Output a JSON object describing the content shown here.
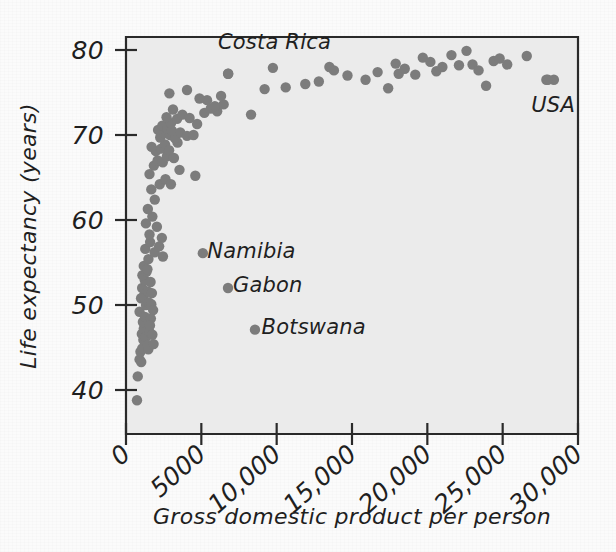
{
  "figure": {
    "background_color": "#fbfbfb",
    "plot_background_color": "#ebebeb",
    "axis_color": "#2a2a2a",
    "point_color": "#7c7c7c"
  },
  "chart_data": {
    "type": "scatter",
    "title": "",
    "xlabel": "Gross domestic product per person",
    "ylabel": "Life expectancy (years)",
    "xlim": [
      0,
      30000
    ],
    "ylim": [
      35,
      82
    ],
    "grid": false,
    "legend": "none",
    "xticks": [
      0,
      5000,
      10000,
      15000,
      20000,
      25000,
      30000
    ],
    "xtick_labels": [
      "0",
      "5000",
      "10,000",
      "15,000",
      "20,000",
      "25,000",
      "30,000"
    ],
    "yticks": [
      40,
      50,
      60,
      70,
      80
    ],
    "ytick_labels": [
      "40",
      "50",
      "60",
      "70",
      "80"
    ],
    "annotations": [
      {
        "text": "Costa Rica",
        "x": 6100,
        "y": 80.9,
        "anchor": "start",
        "point_x": 6780,
        "point_y": 77.2
      },
      {
        "text": "USA",
        "x": 26900,
        "y": 73.5,
        "anchor": "start",
        "point_x": 28000,
        "point_y": 76.5
      },
      {
        "text": "Namibia",
        "x": 5400,
        "y": 56.4,
        "anchor": "start",
        "point_x": 5100,
        "point_y": 56.1
      },
      {
        "text": "Gabon",
        "x": 7100,
        "y": 52.3,
        "anchor": "start",
        "point_x": 6770,
        "point_y": 52.0
      },
      {
        "text": "Botswana",
        "x": 9000,
        "y": 47.4,
        "anchor": "start",
        "point_x": 8560,
        "point_y": 47.1
      }
    ],
    "points": [
      [
        730,
        38.8
      ],
      [
        780,
        41.6
      ],
      [
        900,
        43.6
      ],
      [
        960,
        44.5
      ],
      [
        1010,
        43.3
      ],
      [
        1080,
        44.9
      ],
      [
        1150,
        45.9
      ],
      [
        1050,
        46.6
      ],
      [
        1180,
        47.2
      ],
      [
        1120,
        48.0
      ],
      [
        900,
        49.2
      ],
      [
        1260,
        48.6
      ],
      [
        1310,
        46.2
      ],
      [
        1420,
        45.3
      ],
      [
        1480,
        44.8
      ],
      [
        1540,
        46.9
      ],
      [
        1330,
        50.0
      ],
      [
        1000,
        50.8
      ],
      [
        1160,
        51.0
      ],
      [
        1070,
        52.0
      ],
      [
        1440,
        51.6
      ],
      [
        1510,
        50.3
      ],
      [
        1250,
        52.9
      ],
      [
        1090,
        53.5
      ],
      [
        1360,
        53.9
      ],
      [
        1180,
        54.6
      ],
      [
        1420,
        54.2
      ],
      [
        1630,
        52.7
      ],
      [
        1720,
        51.4
      ],
      [
        1680,
        50.1
      ],
      [
        1800,
        49.4
      ],
      [
        1650,
        48.4
      ],
      [
        1590,
        47.6
      ],
      [
        1750,
        46.5
      ],
      [
        1830,
        45.4
      ],
      [
        1490,
        55.4
      ],
      [
        1280,
        56.6
      ],
      [
        1600,
        57.4
      ],
      [
        1900,
        56.2
      ],
      [
        1560,
        58.3
      ],
      [
        2200,
        56.9
      ],
      [
        2450,
        55.7
      ],
      [
        1320,
        59.6
      ],
      [
        1750,
        60.4
      ],
      [
        2050,
        59.2
      ],
      [
        2380,
        57.9
      ],
      [
        1450,
        61.3
      ],
      [
        1910,
        62.4
      ],
      [
        1680,
        63.6
      ],
      [
        2240,
        64.2
      ],
      [
        2620,
        64.8
      ],
      [
        2980,
        64.2
      ],
      [
        4600,
        65.2
      ],
      [
        3550,
        65.9
      ],
      [
        1560,
        65.4
      ],
      [
        1850,
        66.4
      ],
      [
        2100,
        67.0
      ],
      [
        2440,
        66.8
      ],
      [
        2720,
        67.5
      ],
      [
        1980,
        68.1
      ],
      [
        2330,
        68.4
      ],
      [
        2590,
        68.9
      ],
      [
        1700,
        68.6
      ],
      [
        2860,
        68.2
      ],
      [
        3180,
        67.3
      ],
      [
        3420,
        69.1
      ],
      [
        2270,
        69.7
      ],
      [
        2550,
        70.2
      ],
      [
        2920,
        70.0
      ],
      [
        3260,
        69.6
      ],
      [
        2130,
        70.6
      ],
      [
        2410,
        71.1
      ],
      [
        2760,
        70.8
      ],
      [
        3050,
        70.5
      ],
      [
        3600,
        70.3
      ],
      [
        4050,
        69.9
      ],
      [
        4480,
        70.0
      ],
      [
        2990,
        71.4
      ],
      [
        3390,
        71.9
      ],
      [
        2690,
        72.1
      ],
      [
        3740,
        72.4
      ],
      [
        4220,
        72.0
      ],
      [
        4720,
        71.3
      ],
      [
        5200,
        72.6
      ],
      [
        5620,
        73.1
      ],
      [
        6050,
        72.8
      ],
      [
        6480,
        73.6
      ],
      [
        5380,
        74.1
      ],
      [
        5900,
        73.4
      ],
      [
        6310,
        74.6
      ],
      [
        4880,
        74.3
      ],
      [
        3120,
        73.0
      ],
      [
        2880,
        74.9
      ],
      [
        4050,
        75.3
      ],
      [
        6780,
        77.2
      ],
      [
        8300,
        72.4
      ],
      [
        9200,
        75.4
      ],
      [
        9750,
        77.9
      ],
      [
        10600,
        75.6
      ],
      [
        11900,
        76.0
      ],
      [
        12800,
        76.3
      ],
      [
        13500,
        78.0
      ],
      [
        13800,
        77.6
      ],
      [
        14700,
        77.0
      ],
      [
        15900,
        76.5
      ],
      [
        16700,
        77.4
      ],
      [
        17400,
        75.5
      ],
      [
        17900,
        78.4
      ],
      [
        18100,
        77.2
      ],
      [
        18500,
        77.8
      ],
      [
        19200,
        77.1
      ],
      [
        19700,
        79.1
      ],
      [
        20200,
        78.6
      ],
      [
        20600,
        77.5
      ],
      [
        21000,
        78.0
      ],
      [
        21600,
        79.4
      ],
      [
        22100,
        78.2
      ],
      [
        22600,
        79.9
      ],
      [
        23000,
        78.3
      ],
      [
        23400,
        77.6
      ],
      [
        23900,
        75.8
      ],
      [
        24400,
        78.7
      ],
      [
        24800,
        79.0
      ],
      [
        25300,
        78.3
      ],
      [
        26600,
        79.3
      ],
      [
        27900,
        76.5
      ],
      [
        28400,
        76.5
      ]
    ]
  }
}
